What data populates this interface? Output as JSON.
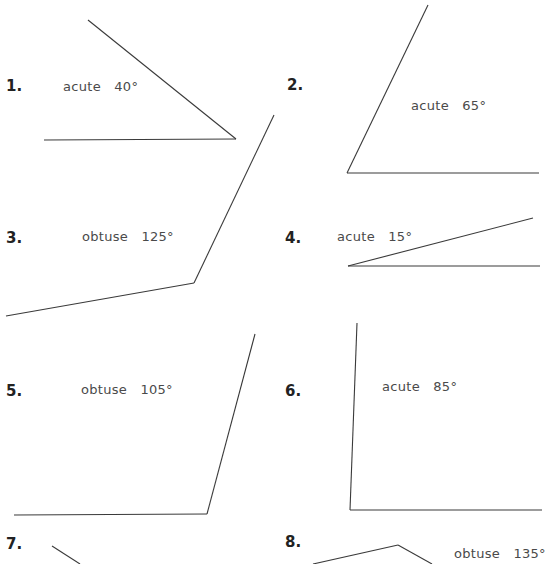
{
  "problems": [
    {
      "number": "1.",
      "label": "acute   40°"
    },
    {
      "number": "2.",
      "label": "acute   65°"
    },
    {
      "number": "3.",
      "label": "obtuse   125°"
    },
    {
      "number": "4.",
      "label": "acute   15°"
    },
    {
      "number": "5.",
      "label": "obtuse   105°"
    },
    {
      "number": "6.",
      "label": "acute   85°"
    },
    {
      "number": "7.",
      "label": ""
    },
    {
      "number": "8.",
      "label": "obtuse   135°"
    }
  ],
  "line_color": "#3a3a3a"
}
